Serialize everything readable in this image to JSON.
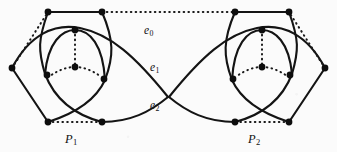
{
  "figure": {
    "type": "graph-diagram",
    "width": 337,
    "height": 152,
    "background_color": "#fbfbfb",
    "ink_color": "#141414"
  },
  "labels": {
    "e0": {
      "base": "e",
      "sub": "0",
      "x": 144,
      "y": 25
    },
    "e1": {
      "base": "e",
      "sub": "1",
      "x": 150,
      "y": 62
    },
    "e2": {
      "base": "e",
      "sub": "2",
      "x": 150,
      "y": 100
    },
    "P1": {
      "base": "P",
      "sub": "1",
      "x": 65,
      "y": 133
    },
    "P2": {
      "base": "P",
      "sub": "2",
      "x": 248,
      "y": 133
    }
  },
  "chart_data": {
    "type": "graph",
    "title": "",
    "vertices": [
      {
        "id": "L-out",
        "x": 12,
        "y": 68
      },
      {
        "id": "L-top-l",
        "x": 48,
        "y": 12
      },
      {
        "id": "L-top-r",
        "x": 102,
        "y": 12
      },
      {
        "id": "L-bot-l",
        "x": 48,
        "y": 122
      },
      {
        "id": "L-bot-r",
        "x": 102,
        "y": 122
      },
      {
        "id": "L-in-top",
        "x": 75,
        "y": 30
      },
      {
        "id": "L-in-mid",
        "x": 75,
        "y": 67
      },
      {
        "id": "L-in-left",
        "x": 50,
        "y": 76
      },
      {
        "id": "L-in-right",
        "x": 100,
        "y": 76
      },
      {
        "id": "R-out",
        "x": 325,
        "y": 68
      },
      {
        "id": "R-top-l",
        "x": 235,
        "y": 12
      },
      {
        "id": "R-top-r",
        "x": 289,
        "y": 12
      },
      {
        "id": "R-bot-l",
        "x": 235,
        "y": 122
      },
      {
        "id": "R-bot-r",
        "x": 289,
        "y": 122
      },
      {
        "id": "R-in-top",
        "x": 262,
        "y": 30
      },
      {
        "id": "R-in-mid",
        "x": 262,
        "y": 67
      },
      {
        "id": "R-in-left",
        "x": 237,
        "y": 76
      },
      {
        "id": "R-in-right",
        "x": 287,
        "y": 76
      }
    ],
    "solid_edges": [
      "L-top-l to L-top-r (top chord)",
      "L-top-l to L-bot-l (left arc)",
      "L-top-r to L-bot-r (right arc)",
      "L-out to L-bot-l (lower-left segment)",
      "L-out to L-in-right (long arc through cluster)",
      "L-in-top arc to L-in-left and L-in-right",
      "L-in-left to L-bot-r, L-in-right to L-bot-l (crossing pair)",
      "e1 long curve from L-out region to R side",
      "e2 long curve from L-bot-r region to R side"
    ],
    "dotted_edges": [
      "e0: L-top-r to R-top-l (horizontal top)",
      "L-in-top to L-in-mid (vertical)",
      "L-in-mid to L-in-left (horizontal)",
      "L-in-mid to L-in-right (horizontal)",
      "L-bot-l to L-bot-r (bottom chord, above P1)",
      "L-out to L-top-l (upper-left diagonal)",
      "R-in-top to R-in-mid (vertical)",
      "R-in-mid to R-in-left (horizontal)",
      "R-in-mid to R-in-right (horizontal)",
      "R-bot-l to R-bot-r (bottom chord, above P2)",
      "R-out to R-top-r (upper-right diagonal)"
    ],
    "crossing_point": {
      "x": 168,
      "y": 97
    },
    "symmetry": "mirror about vertical axis x = 168.5"
  }
}
